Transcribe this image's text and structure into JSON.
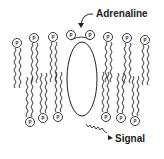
{
  "diagram": {
    "type": "membrane-receptor-schematic",
    "labels": {
      "top": "Adrenaline",
      "bottom": "Signal"
    },
    "head_label": "P",
    "colors": {
      "stroke": "#222222",
      "background": "#ffffff"
    },
    "top_heads": [
      {
        "x": 17,
        "y": 43
      },
      {
        "x": 34,
        "y": 38
      },
      {
        "x": 53,
        "y": 37
      },
      {
        "x": 71,
        "y": 35
      },
      {
        "x": 90,
        "y": 35
      },
      {
        "x": 108,
        "y": 37
      },
      {
        "x": 127,
        "y": 38
      },
      {
        "x": 145,
        "y": 40
      }
    ],
    "bottom_heads": [
      {
        "x": 30,
        "y": 122
      },
      {
        "x": 43,
        "y": 118
      },
      {
        "x": 58,
        "y": 117
      },
      {
        "x": 106,
        "y": 117
      },
      {
        "x": 121,
        "y": 118
      },
      {
        "x": 135,
        "y": 121
      }
    ],
    "receptor": {
      "cx": 82,
      "cy": 79,
      "rx": 15,
      "ry": 37
    }
  }
}
